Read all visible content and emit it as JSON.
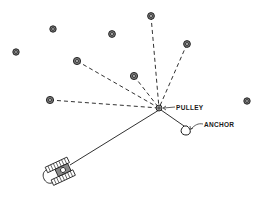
{
  "diagram": {
    "labels": {
      "pulley": "PULLEY",
      "anchor": "ANCHOR"
    },
    "colors": {
      "ink": "#1a1a1a",
      "background": "#ffffff"
    },
    "pulley": {
      "x": 159,
      "y": 108
    },
    "anchor": {
      "x": 186,
      "y": 130
    },
    "tractor": {
      "x": 63,
      "y": 170
    },
    "stumps": [
      {
        "x": 16,
        "y": 52,
        "connected": false
      },
      {
        "x": 53,
        "y": 29,
        "connected": false
      },
      {
        "x": 112,
        "y": 34,
        "connected": false
      },
      {
        "x": 151,
        "y": 16,
        "connected": true
      },
      {
        "x": 187,
        "y": 44,
        "connected": true
      },
      {
        "x": 77,
        "y": 61,
        "connected": true
      },
      {
        "x": 134,
        "y": 76,
        "connected": true
      },
      {
        "x": 50,
        "y": 100,
        "connected": true
      },
      {
        "x": 247,
        "y": 101,
        "connected": false
      }
    ]
  }
}
